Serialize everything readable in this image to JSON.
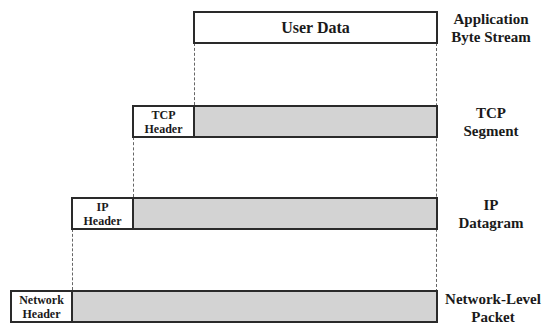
{
  "diagram": {
    "layers": [
      {
        "name": "Application Byte Stream",
        "label_lines": [
          "Application",
          "Byte Stream"
        ],
        "header": null,
        "payload": "User Data"
      },
      {
        "name": "TCP Segment",
        "label_lines": [
          "TCP",
          "Segment"
        ],
        "header_lines": [
          "TCP",
          "Header"
        ]
      },
      {
        "name": "IP Datagram",
        "label_lines": [
          "IP",
          "Datagram"
        ],
        "header_lines": [
          "IP",
          "Header"
        ]
      },
      {
        "name": "Network-Level Packet",
        "label_lines": [
          "Network-Level",
          "Packet"
        ],
        "header_lines": [
          "Network",
          "Header"
        ]
      }
    ],
    "colors": {
      "payload_fill": "#d3d3d3",
      "border": "#2a2a2a",
      "header_fill": "#ffffff"
    }
  }
}
